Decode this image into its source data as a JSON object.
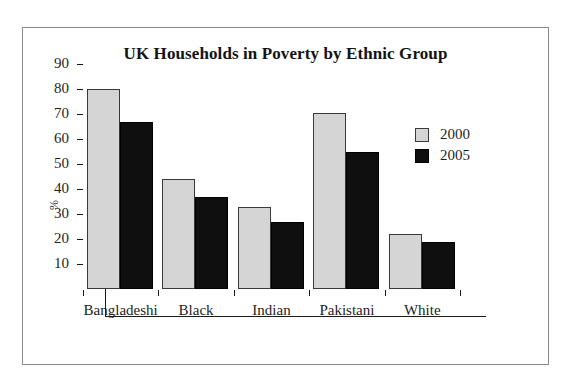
{
  "chart_data": {
    "type": "bar",
    "title": "UK Households in Poverty by Ethnic Group",
    "xlabel": "",
    "ylabel": "%",
    "categories": [
      "Bangladeshi",
      "Black",
      "Indian",
      "Pakistani",
      "White"
    ],
    "series": [
      {
        "name": "2000",
        "color": "#d5d5d5",
        "values": [
          80,
          44,
          33,
          70.5,
          22
        ]
      },
      {
        "name": "2005",
        "color": "#100f0f",
        "values": [
          67,
          37,
          27,
          55,
          19
        ]
      }
    ],
    "ylim": [
      0,
      90
    ],
    "yticks": [
      10,
      20,
      30,
      40,
      50,
      60,
      70,
      80,
      90
    ],
    "ytick_labels": [
      "10",
      "20",
      "30",
      "40",
      "50",
      "60",
      "70",
      "80",
      "90"
    ],
    "grid": false,
    "legend_position": "top-right",
    "legend_entries": [
      "2000",
      "2005"
    ]
  }
}
